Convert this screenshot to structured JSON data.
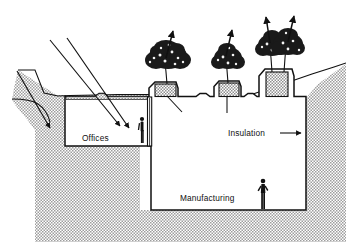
{
  "figure": {
    "type": "architectural-cross-section",
    "background_color": "#ffffff",
    "line_color": "#111111",
    "earth_fill_color": "#d8d8d8",
    "foliage_color": "#1a1a1a"
  },
  "labels": {
    "offices": "Offices",
    "manufacturing": "Manufacturing",
    "insulation": "Insulation"
  },
  "rooms": [
    {
      "name": "Offices",
      "position": "left-upper"
    },
    {
      "name": "Manufacturing",
      "position": "right-lower"
    }
  ],
  "callouts": [
    {
      "text": "Insulation",
      "leader": "horizontal-line-to-right-wall",
      "arrow": "right"
    }
  ],
  "annotations": {
    "sun_rays": [
      {
        "name": "ray-left",
        "direction": "down-right",
        "arrowhead": true
      },
      {
        "name": "ray-upper-1",
        "direction": "down-right",
        "arrowhead": true
      },
      {
        "name": "ray-upper-2",
        "direction": "down-right",
        "arrowhead": true
      }
    ],
    "growth_arrows": [
      {
        "name": "tree-arrow-1",
        "direction": "up-right"
      },
      {
        "name": "tree-arrow-2",
        "direction": "up-right"
      },
      {
        "name": "tree-arrow-3",
        "direction": "up-right"
      },
      {
        "name": "tree-arrow-4",
        "direction": "up-right"
      }
    ]
  },
  "trees": [
    {
      "id": 1,
      "planter": "shallow",
      "canopy": "broad"
    },
    {
      "id": 2,
      "planter": "shallow",
      "canopy": "medium"
    },
    {
      "id": 3,
      "planter": "deep",
      "canopy": "broad"
    },
    {
      "id": 4,
      "planter": "deep",
      "canopy": "broad"
    }
  ],
  "figures": [
    {
      "name": "person-offices",
      "room": "Offices"
    },
    {
      "name": "person-manufacturing",
      "room": "Manufacturing"
    }
  ],
  "terrain": {
    "left": "bermed swale descending to grade",
    "right": "earth slope rising to the right",
    "fill": "stippled earth hatch"
  }
}
